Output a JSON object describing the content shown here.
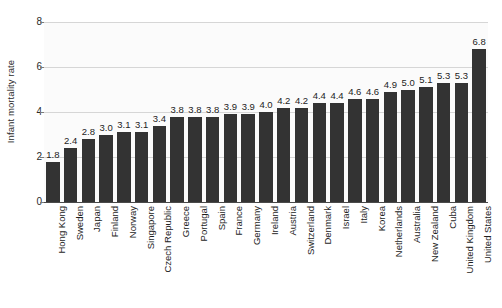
{
  "chart_data": {
    "type": "bar",
    "title": "",
    "subtitle": "",
    "xlabel": "",
    "ylabel": "Infant mortality rate",
    "ylim": [
      0,
      8
    ],
    "yticks": [
      0,
      2,
      4,
      6,
      8
    ],
    "ytick_labels": [
      "0",
      "2",
      "4",
      "6",
      "8"
    ],
    "grid": true,
    "legend": false,
    "bar_color": "#333333",
    "plot_background": "#fbfbfb",
    "gridline_color": "#d6d6d6",
    "categories": [
      "Hong Kong",
      "Sweden",
      "Japan",
      "Finland",
      "Norway",
      "Singapore",
      "Czech Republic",
      "Greece",
      "Portugal",
      "Spain",
      "France",
      "Germany",
      "Ireland",
      "Austria",
      "Switzerland",
      "Denmark",
      "Israel",
      "Italy",
      "Korea",
      "Netherlands",
      "Australia",
      "New Zealand",
      "Cuba",
      "United Kingdom",
      "United States"
    ],
    "values": [
      1.8,
      2.4,
      2.8,
      3.0,
      3.1,
      3.1,
      3.4,
      3.8,
      3.8,
      3.8,
      3.9,
      3.9,
      4.0,
      4.2,
      4.2,
      4.4,
      4.4,
      4.6,
      4.6,
      4.9,
      5.0,
      5.1,
      5.3,
      5.3,
      6.8
    ],
    "value_labels": [
      "1.8",
      "2.4",
      "2.8",
      "3.0",
      "3.1",
      "3.1",
      "3.4",
      "3.8",
      "3.8",
      "3.8",
      "3.9",
      "3.9",
      "4.0",
      "4.2",
      "4.2",
      "4.4",
      "4.4",
      "4.6",
      "4.6",
      "4.9",
      "5.0",
      "5.1",
      "5.3",
      "5.3",
      "6.8"
    ]
  }
}
